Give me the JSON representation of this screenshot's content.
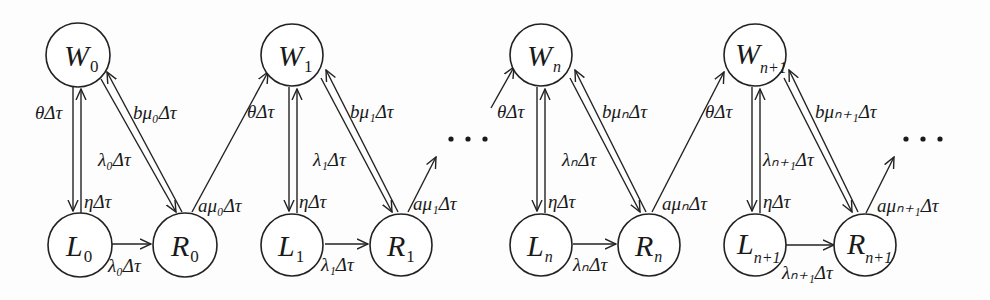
{
  "diagram": {
    "type": "state-transition",
    "blocks": [
      {
        "index": "0",
        "nodes": {
          "W": "W",
          "W_sub": "0",
          "L": "L",
          "L_sub": "0",
          "R": "R",
          "R_sub": "0"
        },
        "edges": {
          "W_to_L": "θΔτ",
          "L_to_W": "ηΔτ",
          "W_to_R": "λ₀Δτ",
          "R_to_W": "bμ₀Δτ",
          "L_to_R": "λ₀Δτ",
          "R_to_next_W": "aμ₀Δτ"
        }
      },
      {
        "index": "1",
        "nodes": {
          "W": "W",
          "W_sub": "1",
          "L": "L",
          "L_sub": "1",
          "R": "R",
          "R_sub": "1"
        },
        "edges": {
          "incoming_W": "θΔτ",
          "L_to_W": "ηΔτ",
          "W_to_R": "λ₁Δτ",
          "R_to_W": "bμ₁Δτ",
          "L_to_R": "λ₁Δτ",
          "R_out": "aμ₁Δτ"
        }
      },
      {
        "index": "n",
        "nodes": {
          "W": "W",
          "W_sub": "n",
          "L": "L",
          "L_sub": "n",
          "R": "R",
          "R_sub": "n"
        },
        "edges": {
          "incoming_W": "θΔτ",
          "L_to_W": "ηΔτ",
          "W_to_R": "λₙΔτ",
          "R_to_W": "bμₙΔτ",
          "L_to_R": "λₙΔτ",
          "R_to_next_W": "aμₙΔτ"
        }
      },
      {
        "index": "n+1",
        "nodes": {
          "W": "W",
          "W_sub": "n+1",
          "L": "L",
          "L_sub": "n+1",
          "R": "R",
          "R_sub": "n+1"
        },
        "edges": {
          "incoming_W": "θΔτ",
          "L_to_W": "ηΔτ",
          "W_to_R": "λₙ₊₁Δτ",
          "R_to_W": "bμₙ₊₁Δτ",
          "L_to_R": "λₙ₊₁Δτ",
          "R_out": "aμₙ₊₁Δτ"
        }
      }
    ],
    "ellipsis": "…"
  }
}
